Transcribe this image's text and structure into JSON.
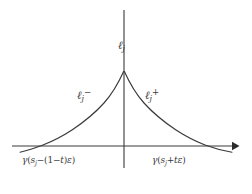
{
  "figure": {
    "background_color": "#ffffff",
    "stroke_color": "#3a3a3a",
    "width": 252,
    "height": 194
  },
  "axes": {
    "horizontal": {
      "name": "horizontal-axis",
      "y": 146,
      "x_start": 12,
      "x_end": 238,
      "arrow": "right"
    },
    "vertical": {
      "name": "vertical-axis",
      "x": 124,
      "y_top": 10,
      "y_bottom": 168,
      "arrow": "none"
    }
  },
  "curve": {
    "name": "cusp-curve",
    "type": "two-sided-exponential-decay",
    "peak_x": 124,
    "peak_y": 71,
    "left_axis_crossing_x": 47,
    "right_axis_crossing_x": 196,
    "left_tail_end_x": 20,
    "right_tail_end_x": 232
  },
  "labels": {
    "vertical_axis": {
      "ell": "ℓ",
      "subscript": "j"
    },
    "left_branch": {
      "ell": "ℓ",
      "subscript": "j",
      "superscript": "−"
    },
    "right_branch": {
      "ell": "ℓ",
      "subscript": "j",
      "superscript": "+"
    },
    "left_endpoint": {
      "gamma": "γ",
      "open_paren": "(",
      "s": "s",
      "s_subscript": "j",
      "minus": "−(1−",
      "t": "t",
      "close_group": ")",
      "epsilon": "ε",
      "close_paren": ")",
      "full": "γ(sⱼ−(1−t)ε)"
    },
    "right_endpoint": {
      "gamma": "γ",
      "open_paren": "(",
      "s": "s",
      "s_subscript": "j",
      "plus": "+",
      "t": "t",
      "epsilon": "ε",
      "close_paren": ")",
      "full": "γ(sⱼ+tε)"
    }
  }
}
